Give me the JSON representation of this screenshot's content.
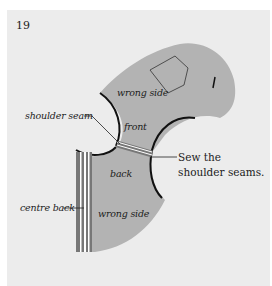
{
  "step": {
    "number": "19"
  },
  "labels": {
    "wrong_side_top": "wrong side",
    "front": "front",
    "shoulder_seam": "shoulder seam",
    "back": "back",
    "centre_back": "centre back",
    "wrong_side_bottom": "wrong side"
  },
  "caption": {
    "text": "Sew the shoulder seams."
  },
  "colors": {
    "page_background": "#ffffff",
    "panel_background": "#ececec",
    "fabric": "#b3b3b3",
    "outline": "#111111",
    "seam_stripe": "#ffffff"
  }
}
